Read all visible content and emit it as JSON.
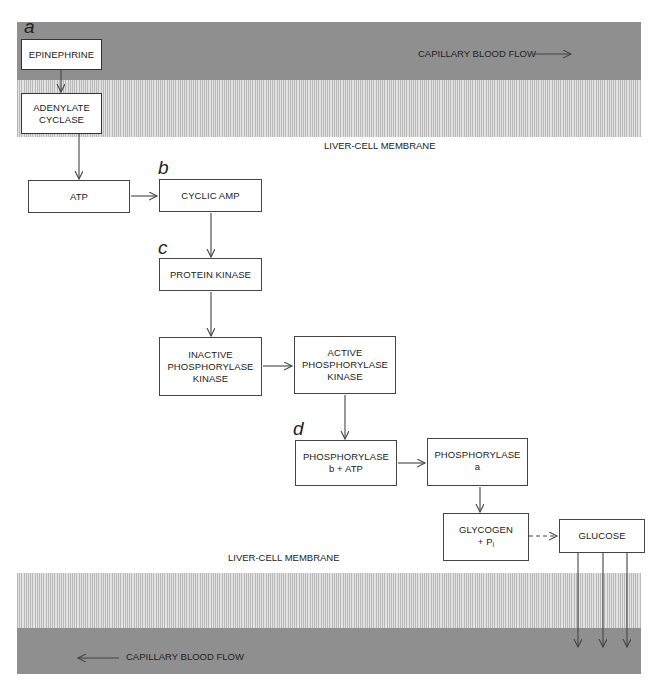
{
  "top_band": {
    "flow_label": "CAPILLARY BLOOD FLOW",
    "flow_direction": "right",
    "membrane_label": "LIVER-CELL MEMBRANE"
  },
  "bottom_band": {
    "flow_label": "CAPILLARY BLOOD FLOW",
    "flow_direction": "left",
    "membrane_label": "LIVER-CELL MEMBRANE"
  },
  "step_letters": [
    "a",
    "b",
    "c",
    "d"
  ],
  "nodes": {
    "epinephrine": "EPINEPHRINE",
    "adenylate_cyclase": [
      "ADENYLATE",
      "CYCLASE"
    ],
    "atp": "ATP",
    "cyclic_amp": "CYCLIC AMP",
    "protein_kinase": "PROTEIN KINASE",
    "inactive_pk": [
      "INACTIVE",
      "PHOSPHORYLASE",
      "KINASE"
    ],
    "active_pk": [
      "ACTIVE",
      "PHOSPHORYLASE",
      "KINASE"
    ],
    "phosphorylase_b": [
      "PHOSPHORYLASE",
      "b + ATP"
    ],
    "phosphorylase_a": [
      "PHOSPHORYLASE",
      "a"
    ],
    "glycogen": [
      "GLYCOGEN",
      "+ P",
      "i"
    ],
    "glucose": "GLUCOSE"
  },
  "edges": [
    {
      "from": "EPINEPHRINE",
      "to": "ADENYLATE CYCLASE",
      "style": "solid"
    },
    {
      "from": "ADENYLATE CYCLASE",
      "to": "ATP",
      "style": "solid"
    },
    {
      "from": "ATP",
      "to": "CYCLIC AMP",
      "style": "solid"
    },
    {
      "from": "CYCLIC AMP",
      "to": "PROTEIN KINASE",
      "style": "solid"
    },
    {
      "from": "PROTEIN KINASE",
      "to": "INACTIVE PHOSPHORYLASE KINASE",
      "style": "solid"
    },
    {
      "from": "INACTIVE PHOSPHORYLASE KINASE",
      "to": "ACTIVE PHOSPHORYLASE KINASE",
      "style": "solid"
    },
    {
      "from": "ACTIVE PHOSPHORYLASE KINASE",
      "to": "PHOSPHORYLASE b + ATP",
      "style": "solid"
    },
    {
      "from": "PHOSPHORYLASE b + ATP",
      "to": "PHOSPHORYLASE a",
      "style": "solid"
    },
    {
      "from": "PHOSPHORYLASE a",
      "to": "GLYCOGEN + Pi",
      "style": "solid"
    },
    {
      "from": "GLYCOGEN + Pi",
      "to": "GLUCOSE",
      "style": "dashed"
    },
    {
      "from": "GLUCOSE",
      "to": "CAPILLARY BLOOD FLOW (bottom)",
      "style": "solid",
      "count": 3
    }
  ],
  "colors": {
    "blood": "#8f8f8f",
    "membrane_hatch": "#b9b9b9",
    "line": "#444444"
  }
}
